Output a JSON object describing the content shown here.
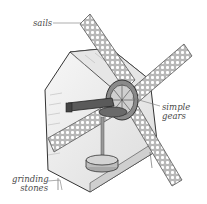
{
  "diagram": {
    "labels": {
      "sails": "sails",
      "gears_line1": "simple",
      "gears_line2": "gears",
      "stones_line1": "grinding",
      "stones_line2": "stones"
    },
    "colors": {
      "background": "#ffffff",
      "sail_fill": "#bdbdbd",
      "sail_holes": "#ffffff",
      "building_fill": "#f2f2f2",
      "building_shade": "#d8d8d8",
      "gear_dark": "#5a5a5a",
      "outline": "#333333",
      "label_text": "#4a4a4a",
      "leader_line": "#777777"
    }
  }
}
